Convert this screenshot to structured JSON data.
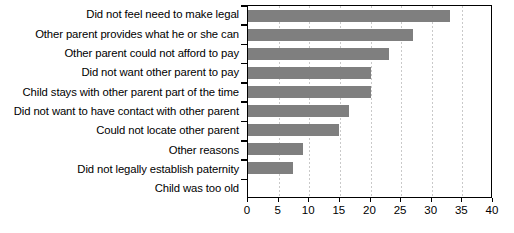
{
  "chart_data": {
    "type": "bar",
    "orientation": "horizontal",
    "title": "",
    "subtitle": "",
    "xlabel": "",
    "ylabel": "",
    "xlim": [
      0,
      40
    ],
    "xticks": [
      0,
      5,
      10,
      15,
      20,
      25,
      30,
      35,
      40
    ],
    "grid": "vertical-dashed",
    "legend": "none",
    "bar_color": "#7f7f7f",
    "categories": [
      "Did not feel need to make legal",
      "Other parent provides what he or she can",
      "Other parent could not afford to pay",
      "Did not want other parent to pay",
      "Child stays with other parent part of the time",
      "Did not want to have contact with other parent",
      "Could not locate other parent",
      "Other reasons",
      "Did not legally establish paternity",
      "Child was too old"
    ],
    "values": [
      33,
      27,
      23,
      20,
      20,
      16.5,
      14.8,
      9,
      7.4,
      0
    ]
  }
}
